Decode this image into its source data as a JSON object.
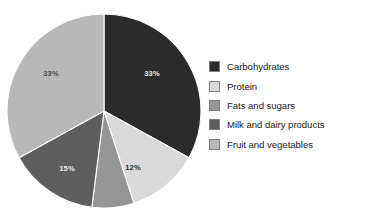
{
  "chart_data": {
    "type": "pie",
    "title": "",
    "categories": [
      "Carbohydrates",
      "Protein",
      "Fats and sugars",
      "Milk and dairy products",
      "Fruit and vegetables"
    ],
    "values": [
      33,
      12,
      7,
      15,
      33
    ],
    "value_labels": [
      "33%",
      "12%",
      "",
      "15%",
      "33%"
    ],
    "colors": [
      "#2b2b2b",
      "#d9d9d9",
      "#959595",
      "#5e5e5e",
      "#b8b8b8"
    ],
    "units": "percent",
    "legend_position": "right",
    "grid": false,
    "xlabel": "",
    "ylabel": "",
    "start_angle_deg": 0,
    "direction": "clockwise",
    "slices": [
      {
        "name": "Carbohydrates",
        "value": 33,
        "label": "33%",
        "color": "#2b2b2b",
        "label_color": "#e8e8e8",
        "start_deg": 0,
        "end_deg": 118.8,
        "label_x": 152,
        "label_y": 76
      },
      {
        "name": "Protein",
        "value": 12,
        "label": "12%",
        "color": "#d9d9d9",
        "label_color": "#2b2b2b",
        "start_deg": 118.8,
        "end_deg": 162.0,
        "label_x": 133,
        "label_y": 170
      },
      {
        "name": "Fats and sugars",
        "value": 7,
        "label": "",
        "color": "#959595",
        "label_color": "#2b2b2b",
        "start_deg": 162.0,
        "end_deg": 187.2,
        "label_x": 0,
        "label_y": 0
      },
      {
        "name": "Milk and dairy products",
        "value": 15,
        "label": "15%",
        "color": "#5e5e5e",
        "label_color": "#ededed",
        "start_deg": 187.2,
        "end_deg": 241.2,
        "label_x": 67,
        "label_y": 171
      },
      {
        "name": "Fruit and vegetables",
        "value": 33,
        "label": "33%",
        "color": "#b8b8b8",
        "label_color": "#4a4a4a",
        "start_deg": 241.2,
        "end_deg": 360.0,
        "label_x": 51,
        "label_y": 76
      }
    ]
  },
  "legend": {
    "items": [
      {
        "label": "Carbohydrates",
        "color": "#2b2b2b"
      },
      {
        "label": "Protein",
        "color": "#d9d9d9"
      },
      {
        "label": "Fats and sugars",
        "color": "#959595"
      },
      {
        "label": "Milk and dairy products",
        "color": "#5e5e5e"
      },
      {
        "label": "Fruit and vegetables",
        "color": "#b8b8b8"
      }
    ]
  },
  "geometry": {
    "center_x": 104,
    "center_y": 111,
    "radius": 97
  }
}
